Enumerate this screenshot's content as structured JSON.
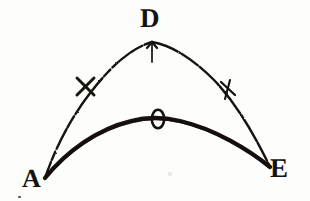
{
  "figure": {
    "kind": "geometric-arc-diagram",
    "medium": "scanned engraving",
    "background_color": "#fdfdfc",
    "ink_color": "#141210",
    "width": 310,
    "height": 201
  },
  "labels": {
    "apex_upper": "D",
    "left_base": "A",
    "right_base": "E",
    "apex_lower": "O"
  },
  "points": {
    "A": {
      "x": 45,
      "y": 178
    },
    "D": {
      "x": 152,
      "y": 42
    },
    "E": {
      "x": 270,
      "y": 167
    },
    "O": {
      "x": 158,
      "y": 119
    }
  },
  "curves": [
    {
      "name": "upper-arc",
      "label": "A-D-E",
      "style": "thin broken line",
      "stroke_width": 2.2,
      "from": "A",
      "apex": "D",
      "to": "E"
    },
    {
      "name": "lower-arc",
      "label": "A-O-E",
      "style": "thick solid line",
      "stroke_width": 4.2,
      "from": "A",
      "apex": "O",
      "to": "E"
    }
  ],
  "ticks": [
    {
      "name": "apex-tick",
      "shape": "vertical-stroke",
      "x": 152,
      "y": 50
    },
    {
      "name": "left-cross-tick",
      "shape": "x-cross",
      "x": 85,
      "y": 86
    },
    {
      "name": "right-cross-tick",
      "shape": "slash-cross",
      "x": 228,
      "y": 88
    }
  ],
  "markers": [
    {
      "name": "o-marker",
      "shape": "small-oval-outline",
      "x": 158,
      "y": 119,
      "rx": 6,
      "ry": 9
    }
  ]
}
